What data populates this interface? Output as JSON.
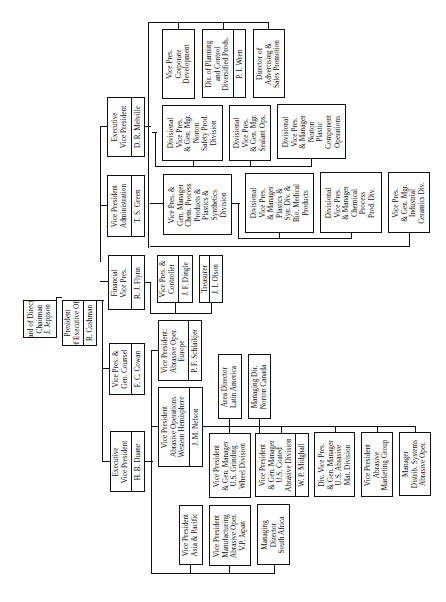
{
  "chart_title": "",
  "nodes": {
    "board": {
      "title": "Board of Directors\nChairman\nJ. Jeppson"
    },
    "president": {
      "title": "President\nChief Executive Officer",
      "name": "R. Cushman"
    },
    "evp_duane": {
      "title": "Executive\nVice President",
      "name": "H. B. Duane"
    },
    "vp_counsel": {
      "title": "Vice Pres. &\nGen. Counsel",
      "name": "F. C. Cowan"
    },
    "financial_vp": {
      "title": "Financial\nVice Pres.",
      "name": "R. J. Flynn"
    },
    "vp_admin": {
      "title": "Vice President\nAdministration",
      "name": "T. S. Green"
    },
    "evp_melville": {
      "title": "Executive\nVice President",
      "name": "D. R. Melville"
    },
    "controller": {
      "title": "Vice Pres. &\nController",
      "name": "J. F. Dingle"
    },
    "treasurer": {
      "title": "Treasurer",
      "name": "J. I. Olson"
    },
    "vp_europe": {
      "title": "Vice President:\nAbrasive Oper.\nEurope",
      "name": "P. F. Schlaikjer"
    },
    "vp_western": {
      "title": "Vice President\nAbrasive Operations\nWestern Hemisphere",
      "name": "J. M. Nelson"
    },
    "latin_america": {
      "title": "Area Director\nLatin America"
    },
    "norton_canada": {
      "title": "Managing Dir.\nNorton Canada"
    },
    "grinding_wheel": {
      "title": "Vice President\n& Gen. Manager\nU.S. Grinding\nWheel Division"
    },
    "coated_abrasive": {
      "title": "Vice President\n& Gen. Manager\nU.S. Coated\nAbrasive Division",
      "name": "W. P. Midghall"
    },
    "abrasive_mat": {
      "title": "Div. Vice Pres.\n& Gen. Manager\nU.S. Abrasive\nMat. Division"
    },
    "abrasive_marketing": {
      "title": "Vice President\nAbrasive\nMarketing Group"
    },
    "distrib_systems": {
      "title": "Manager\nDistrib. Systems\nAbrasive Oper."
    },
    "asia_pacific": {
      "title": "Vice President\nAsia & Pacific"
    },
    "manufacturing_japan": {
      "title": "Vice President\nManufacturing\nAbrasive Oper.\nV.P. Japan"
    },
    "south_africa": {
      "title": "Managing\nDirector\nSouth Africa"
    },
    "corp_dev": {
      "title": "Vice Pres.\nCorporate\nDevelopment"
    },
    "planning_control": {
      "title": "Dir. of Planning\nand Control\nDiversified Prods.",
      "name": "P. I. Wren"
    },
    "advertising": {
      "title": "Director of\nAdvertising &\nSales Promotion"
    },
    "safety_prod": {
      "title": "Divisional\nVice Pres.\n& Gen. Mgr.\nNorton\nSafety Prod.\nDivision"
    },
    "sealant_ops": {
      "title": "Divisional\nVice Pres.\n& Gen. Mgr.\nSealant Ops."
    },
    "plastic_component": {
      "title": "Divisional\nVice Pres.\n& Manager\nNorton\nPlastic\nComponent\nOperations"
    },
    "chem_process": {
      "title": "Vice Pres. &\nGen. Manager\nChem. Process\nProducts &\nPlastics &\nSynthetics\nDivision"
    },
    "bio_medical": {
      "title": "Divisional\nVice Pres.\n& Manager\nPlastics &\nSyn. Div. &\nBio. Medical\nProducts"
    },
    "chemical_process_div": {
      "title": "Divisional\nVice Pres.\n& Manager\nChemical\nProcess\nProd. Div."
    },
    "industrial_ceramics": {
      "title": "Vice Pres.\n& Gen. Mgr.\nIndustrial\nCeramics Div."
    }
  }
}
